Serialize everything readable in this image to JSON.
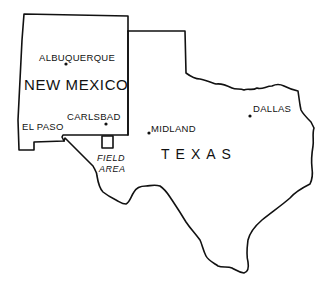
{
  "map": {
    "states": [
      {
        "name": "NEW MEXICO"
      },
      {
        "name": "TEXAS"
      }
    ],
    "cities": [
      {
        "name": "ALBUQUERQUE"
      },
      {
        "name": "CARLSBAD"
      },
      {
        "name": "EL PASO"
      },
      {
        "name": "MIDLAND"
      },
      {
        "name": "DALLAS"
      }
    ],
    "field_area": {
      "line1": "FIELD",
      "line2": "AREA"
    },
    "colors": {
      "line": "#111111",
      "background": "#ffffff"
    }
  }
}
